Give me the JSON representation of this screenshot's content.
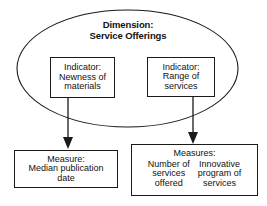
{
  "diagram": {
    "type": "concept-hierarchy",
    "title": "Dimension: Service Offerings",
    "dimension": {
      "label_line1": "Dimension:",
      "label_line2": "Service Offerings"
    },
    "indicators": [
      {
        "id": "newness",
        "line1": "Indicator:",
        "line2": "Newness of",
        "line3": "materials"
      },
      {
        "id": "range",
        "line1": "Indicator:",
        "line2": "Range of",
        "line3": "services"
      }
    ],
    "measures_left": {
      "line1": "Measure:",
      "line2": "Median publication",
      "line3": "date"
    },
    "measures_right": {
      "heading": "Measures:",
      "columns": [
        {
          "line1": "Number of",
          "line2": "services",
          "line3": "offered"
        },
        {
          "line1": "Innovative",
          "line2": "program of",
          "line3": "services"
        }
      ]
    },
    "connectors": [
      {
        "from": "newness",
        "to": "measures_left",
        "style": "arrow-down"
      },
      {
        "from": "range",
        "to": "measures_right",
        "style": "arrow-down"
      }
    ],
    "colors": {
      "stroke": "#1a1a1a",
      "text": "#111111",
      "background": "#ffffff"
    }
  }
}
